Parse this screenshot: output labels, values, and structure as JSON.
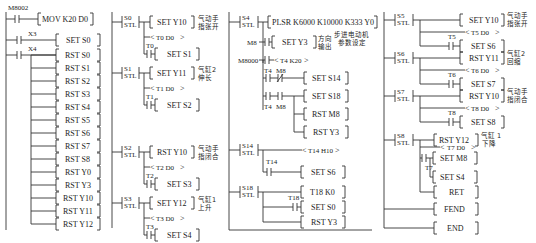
{
  "columns": [
    {
      "id": "col1",
      "rungs": [
        {
          "contact": "M8002",
          "instr": "MOV K20 D0"
        },
        {
          "contact": "X3",
          "instr": "SET S0"
        },
        {
          "contact": "X4",
          "instrs": [
            "RST S0",
            "RST S1",
            "RST S2",
            "RST S3",
            "RST S4",
            "RST S5",
            "RST S6",
            "RST S7",
            "RST S8",
            "RST Y0",
            "RST Y3",
            "RST Y10",
            "RST Y11",
            "RST Y12"
          ]
        }
      ]
    },
    {
      "id": "col2",
      "steps": [
        {
          "state": "S0",
          "stl": "STL",
          "action": "SET Y10",
          "comment": [
            "气动手",
            "指张开"
          ],
          "timer": "T0 D0",
          "tcontact": "T0",
          "next": "SET S1"
        },
        {
          "state": "S1",
          "stl": "STL",
          "action": "SET Y11",
          "comment": [
            "气缸2",
            "伸长"
          ],
          "timer": "T1 D0",
          "tcontact": "T1",
          "next": "SET S2"
        },
        {
          "state": "S2",
          "stl": "STL",
          "action": "RST Y10",
          "comment": [
            "气动手",
            "指闭合"
          ],
          "timer": "T2 D0",
          "tcontact": "T2",
          "next": "SET S3"
        },
        {
          "state": "S3",
          "stl": "STL",
          "action": "SET Y12",
          "comment": [
            "气缸1",
            "上升"
          ],
          "timer": "T3 D0",
          "tcontact": "T3",
          "next": "SET S4"
        }
      ]
    },
    {
      "id": "col3",
      "s4": {
        "state": "S4",
        "stl": "STL",
        "plsr": "PLSR K6000 K10000 K333 Y0",
        "m8_contact": "M8",
        "set_y3": "SET Y3",
        "dir_comment": [
          "方向",
          "输出"
        ],
        "stepper_comment": [
          "步进电动机",
          "参数设定"
        ],
        "m8000_contact": "M8000",
        "timer": "T4 K20",
        "t4a": "T4",
        "m8a": "M8",
        "set_s14": "SET S14",
        "t4b": "T4",
        "m8b": "M8",
        "set_s18": "SET S18",
        "rst_m8": "RST M8",
        "rst_y3": "RST Y3"
      },
      "s14": {
        "state": "S14",
        "stl": "STL",
        "timer": "T14 H10",
        "tcontact": "T14",
        "next": "SET S6"
      },
      "s18": {
        "state": "S18",
        "stl": "STL",
        "timer": "T18 K0",
        "tcontact": "T18",
        "next": "SET S0",
        "rst": "RST Y3"
      }
    },
    {
      "id": "col4",
      "steps": [
        {
          "state": "S5",
          "stl": "STL",
          "action": "SET Y10",
          "comment": [
            "气动手",
            "指张开"
          ],
          "timer": "T5 D0",
          "tcontact": "T5",
          "next": "SET S6"
        },
        {
          "state": "S6",
          "stl": "STL",
          "action": "RST Y11",
          "comment": [
            "气缸2",
            "回缩"
          ],
          "timer": "T6 D0",
          "tcontact": "T6",
          "next": "SET S7"
        },
        {
          "state": "S7",
          "stl": "STL",
          "action": "RST Y10",
          "comment": [
            "气动手",
            "指闭合"
          ],
          "timer": "T8 D0",
          "tcontact": "T8",
          "next": "SET S8"
        }
      ],
      "s8": {
        "state": "S8",
        "stl": "STL",
        "action": "RST Y12",
        "comment": [
          "气缸 1",
          "下降"
        ],
        "timer": "T7 D0",
        "tcontact": "T7",
        "set_m8": "SET M8",
        "set_s4": "SET S4",
        "ret": "RET"
      },
      "fend": "FEND",
      "end": "END"
    }
  ]
}
